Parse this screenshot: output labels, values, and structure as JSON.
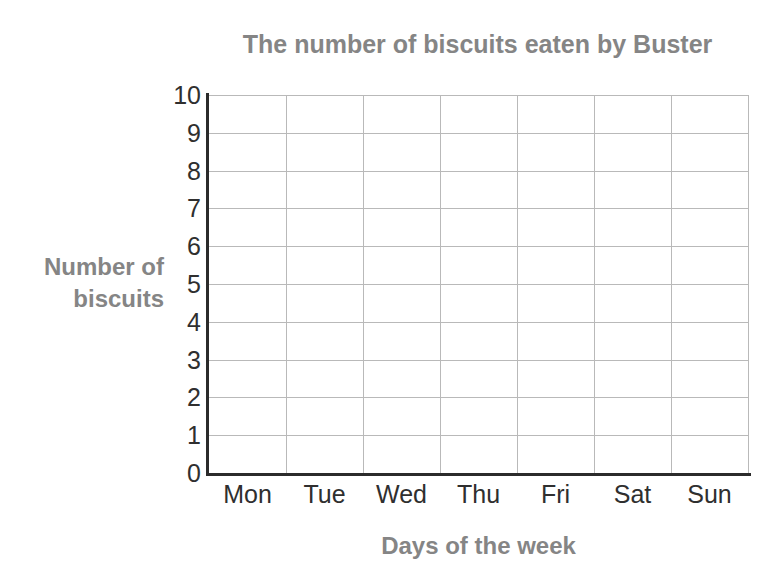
{
  "chart_data": {
    "type": "bar",
    "title": "The number of biscuits eaten by Buster",
    "xlabel": "Days of the week",
    "ylabel": "Number of biscuits",
    "ylabel_lines": [
      "Number of",
      "biscuits"
    ],
    "categories": [
      "Mon",
      "Tue",
      "Wed",
      "Thu",
      "Fri",
      "Sat",
      "Sun"
    ],
    "values": [
      null,
      null,
      null,
      null,
      null,
      null,
      null
    ],
    "ylim": [
      0,
      10
    ],
    "ytick_step": 1,
    "yticks": [
      10,
      9,
      8,
      7,
      6,
      5,
      4,
      3,
      2,
      1,
      0
    ],
    "grid": true,
    "legend": false,
    "note": "blank grid - no bars plotted",
    "colors": {
      "title_text": "#858585",
      "axis_title_text": "#858585",
      "tick_text": "#2f2f2f",
      "gridline": "#b9b9b9",
      "axis_line": "#2b2b2b",
      "background": "#ffffff"
    }
  }
}
